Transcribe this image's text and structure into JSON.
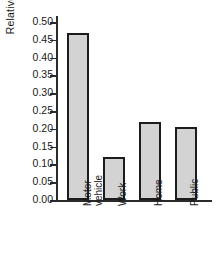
{
  "chart_data": {
    "type": "bar",
    "title": "",
    "subtitle": "",
    "xlabel": "",
    "ylabel": "Relative frequency",
    "categories": [
      "Motor vehicle",
      "Work",
      "Home",
      "Public"
    ],
    "category_lines": [
      [
        "Motor",
        "vehicle"
      ],
      [
        "Work"
      ],
      [
        "Home"
      ],
      [
        "Public"
      ]
    ],
    "values": [
      0.47,
      0.12,
      0.22,
      0.205
    ],
    "ylim": [
      0.0,
      0.5
    ],
    "ytick_step": 0.05,
    "ytick_labels": [
      "0.00",
      "0.05",
      "0.10",
      "0.15",
      "0.20",
      "0.25",
      "0.30",
      "0.35",
      "0.40",
      "0.45",
      "0.50"
    ],
    "ytick_values": [
      0.0,
      0.05,
      0.1,
      0.15,
      0.2,
      0.25,
      0.3,
      0.35,
      0.4,
      0.45,
      0.5
    ],
    "grid": false,
    "legend": false,
    "legend_position": "none",
    "bar_fill_color": "#d3d3d3",
    "bar_edge_color": "#1c1c1c",
    "axis_color": "#2b2b2b",
    "background_color": "#ffffff"
  }
}
